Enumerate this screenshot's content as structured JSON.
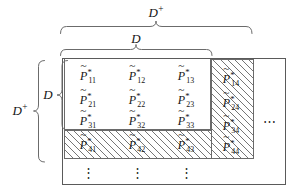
{
  "figure": {
    "symbol_base": "P",
    "symbol_accent": "~",
    "symbol_superscript": "*"
  },
  "braces": {
    "top_outer": {
      "label": "D",
      "sup": "+",
      "name": "brace-top-d-plus"
    },
    "top_inner": {
      "label": "D",
      "sup": "",
      "name": "brace-top-d"
    },
    "left_outer": {
      "label": "D",
      "sup": "+",
      "name": "brace-left-d-plus"
    },
    "left_inner": {
      "label": "D",
      "sup": "",
      "name": "brace-left-d"
    }
  },
  "matrix": {
    "rows": [
      {
        "cells": [
          {
            "sub": "11",
            "hatched": false
          },
          {
            "sub": "12",
            "hatched": false
          },
          {
            "sub": "13",
            "hatched": false
          },
          {
            "sub": "14",
            "hatched": true
          }
        ]
      },
      {
        "cells": [
          {
            "sub": "21",
            "hatched": false
          },
          {
            "sub": "22",
            "hatched": false
          },
          {
            "sub": "23",
            "hatched": false
          },
          {
            "sub": "24",
            "hatched": true
          }
        ]
      },
      {
        "cells": [
          {
            "sub": "31",
            "hatched": false
          },
          {
            "sub": "32",
            "hatched": false
          },
          {
            "sub": "33",
            "hatched": false
          },
          {
            "sub": "34",
            "hatched": true
          }
        ]
      },
      {
        "cells": [
          {
            "sub": "41",
            "hatched": true
          },
          {
            "sub": "42",
            "hatched": true
          },
          {
            "sub": "43",
            "hatched": true
          },
          {
            "sub": "44",
            "hatched": true
          }
        ]
      }
    ]
  },
  "ellipses": {
    "horizontal": "⋯",
    "vertical": "⋮",
    "vertical_count": 3,
    "horizontal_count": 1
  },
  "cells_flat": {
    "c11": "11",
    "c12": "12",
    "c13": "13",
    "c14": "14",
    "c21": "21",
    "c22": "22",
    "c23": "23",
    "c24": "24",
    "c31": "31",
    "c32": "32",
    "c33": "33",
    "c34": "34",
    "c41": "41",
    "c42": "42",
    "c43": "43",
    "c44": "44"
  },
  "colors": {
    "ink": "#141414",
    "rule": "#5a5a5a",
    "hatch": "#767676",
    "background": "#ffffff"
  }
}
